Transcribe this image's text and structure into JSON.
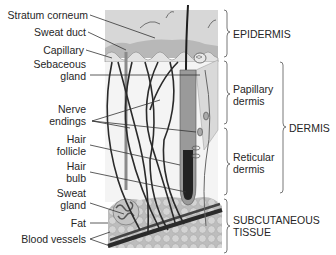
{
  "figure": {
    "type": "anatomical-diagram"
  },
  "left_labels": [
    {
      "id": "stratum-corneum",
      "text": "Stratum corneum"
    },
    {
      "id": "sweat-duct",
      "text": "Sweat duct"
    },
    {
      "id": "capillary",
      "text": "Capillary"
    },
    {
      "id": "sebaceous-gland",
      "line1": "Sebaceous",
      "line2": "gland"
    },
    {
      "id": "nerve-endings",
      "line1": "Nerve",
      "line2": "endings"
    },
    {
      "id": "hair-follicle",
      "line1": "Hair",
      "line2": "follicle"
    },
    {
      "id": "hair-bulb",
      "line1": "Hair",
      "line2": "bulb"
    },
    {
      "id": "sweat-gland",
      "line1": "Sweat",
      "line2": "gland"
    },
    {
      "id": "fat",
      "text": "Fat"
    },
    {
      "id": "blood-vessels",
      "text": "Blood vessels"
    }
  ],
  "layer_labels": {
    "epidermis": "EPIDERMIS",
    "papillary_dermis": {
      "line1": "Papillary",
      "line2": "dermis"
    },
    "reticular_dermis": {
      "line1": "Reticular",
      "line2": "dermis"
    },
    "dermis": "DERMIS",
    "subcutaneous": {
      "line1": "SUBCUTANEOUS",
      "line2": "TISSUE"
    }
  },
  "colors": {
    "epidermis_fill": "#d9d9d9",
    "stratum_fill": "#bdbdbd",
    "dermis_fill": "#f3f3f3",
    "fat_fill": "#c8c8c8",
    "vessel": "#2b2b2b",
    "leader_line": "#333333"
  }
}
